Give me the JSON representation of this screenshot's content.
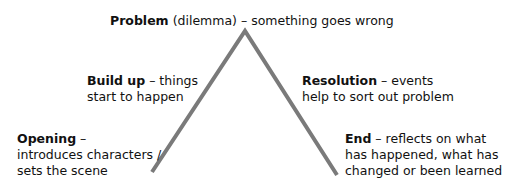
{
  "diagram": {
    "type": "story-mountain",
    "line_color": "#7a7a7a",
    "stages": {
      "problem": {
        "title": "Problem",
        "note": " (dilemma) –  ",
        "desc": "something goes wrong"
      },
      "build_up": {
        "title": "Build up",
        "sep": " –  ",
        "line1": "things",
        "line2": "start to happen"
      },
      "resolution": {
        "title": "Resolution",
        "sep": " –  ",
        "line1": "events",
        "line2": "help to sort out problem"
      },
      "opening": {
        "title": "Opening",
        "sep": " –",
        "line1": "introduces characters /",
        "line2": "sets the scene"
      },
      "end": {
        "title": "End",
        "sep": " – ",
        "line1": "reflects on what",
        "line2": "has happened, what has",
        "line3": "changed or been learned"
      }
    }
  }
}
